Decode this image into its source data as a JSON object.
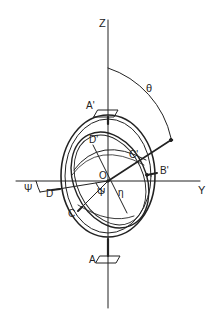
{
  "diagram": {
    "colors": {
      "stroke": "#222222",
      "background": "#ffffff"
    },
    "labels": {
      "z_axis": "Z",
      "y_axis": "Y",
      "theta": "θ",
      "psi_outer": "Ψ",
      "psi_inner": "Ψ",
      "eta": "η",
      "origin": "O",
      "a_prime": "A'",
      "a": "A",
      "b_prime": "B'",
      "c_prime": "C'",
      "c": "C",
      "d_prime": "D'",
      "d": "D"
    }
  }
}
